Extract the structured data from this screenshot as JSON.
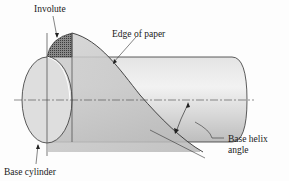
{
  "figure": {
    "labels": {
      "involute": "Involute",
      "edge_of_paper": "Edge of paper",
      "base_helix_angle_line1": "Base helix",
      "base_helix_angle_line2": "angle",
      "base_cylinder": "Base cylinder"
    },
    "colors": {
      "line": "#333333",
      "cylinder_fill": "#d9d9d9",
      "cylinder_highlight": "#eeeeee",
      "paper_fill": "#c8c8c8",
      "involute_hatch": "#555555",
      "background": "#fdfdfd"
    }
  }
}
